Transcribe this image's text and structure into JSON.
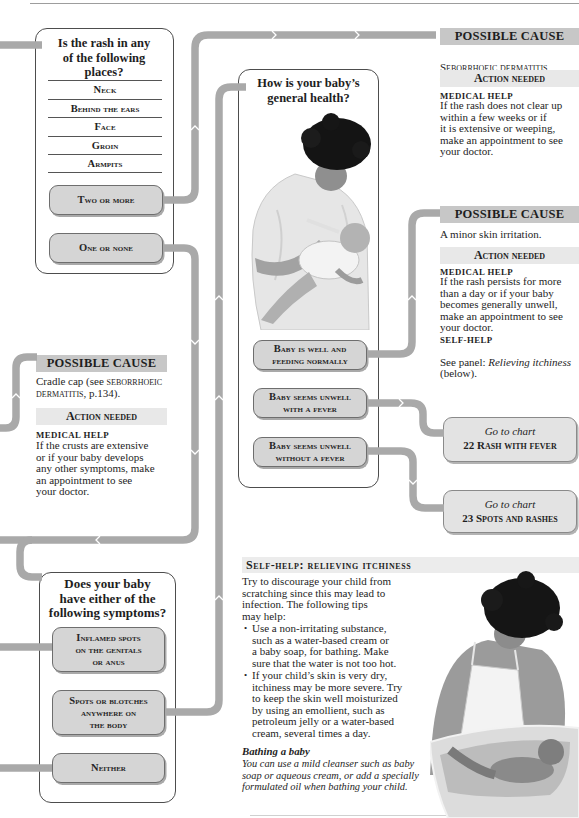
{
  "colors": {
    "connector": "#a9a9a9",
    "hdr-cause": "#c7c7c7",
    "hdr-action": "#e8e8e8",
    "option-fill": "#d5d5d5",
    "goto-fill": "#e3e3e3",
    "border": "#4d4d4d"
  },
  "images": {
    "feeding_photo": "mother bottle-feeding baby",
    "bathing_photo": "mother bathing baby in tub"
  },
  "question_location": {
    "title": "Is the rash in any\nof the following\nplaces?",
    "places": [
      "Neck",
      "Behind the ears",
      "Face",
      "Groin",
      "Armpits"
    ],
    "options": [
      "Two or more",
      "One or none"
    ]
  },
  "cause_seborrhoeic": {
    "header": "POSSIBLE CAUSE",
    "cause": "Seborrhoeic dermatitis",
    "cause_ref": " (p.134).",
    "action_header": "Action needed",
    "medical_label": "MEDICAL HELP",
    "medical_text": "If the rash does not clear up\nwithin a few weeks or if\nit is extensive or weeping,\nmake an appointment to see\nyour doctor."
  },
  "question_health": {
    "title": "How is your baby’s\ngeneral health?",
    "options": [
      "Baby is well and\nfeeding normally",
      "Baby seems unwell\nwith a fever",
      "Baby seems unwell\nwithout a fever"
    ]
  },
  "cause_minor": {
    "header": "POSSIBLE CAUSE",
    "cause": "A minor skin irritation.",
    "action_header": "Action needed",
    "medical_label": "MEDICAL HELP",
    "medical_text": "If the rash persists for more\nthan a day or if your baby\nbecomes generally unwell,\nmake an appointment to see\nyour doctor.",
    "selfhelp_label": "SELF-HELP",
    "selfhelp_prefix": "See panel: ",
    "selfhelp_link": "Relieving itchiness",
    "selfhelp_suffix": " (below)."
  },
  "goto": [
    {
      "prefix": "Go to chart",
      "number": "22",
      "title": "Rash with fever"
    },
    {
      "prefix": "Go to chart",
      "number": "23",
      "title": "Spots and rashes"
    }
  ],
  "cause_cradle": {
    "header": "POSSIBLE CAUSE",
    "cause_prefix": "Cradle cap (see ",
    "cause_ref": "seborrhoeic dermatitis",
    "cause_suffix": ", p.134).",
    "action_header": "Action needed",
    "medical_label": "MEDICAL HELP",
    "medical_text": "If the crusts are extensive\nor if your baby develops\nany other symptoms, make\nan appointment to see\nyour doctor."
  },
  "question_symptoms": {
    "title": "Does your baby\nhave either of the\nfollowing symptoms?",
    "options": [
      "Inflamed spots\non the genitals\nor anus",
      "Spots or blotches\nanywhere on\nthe body",
      "Neither"
    ]
  },
  "selfhelp_panel": {
    "title": "Self-help: relieving itchiness",
    "intro": "Try to discourage your child from\nscratching since this may lead to\ninfection. The following tips\nmay help:",
    "bullets": [
      "Use a non-irritating substance,\nsuch as a water-based cream or\na baby soap, for bathing. Make\nsure that the water is not too hot.",
      "If your child’s skin is very dry,\nitchiness may be more severe. Try\nto keep the skin well moisturized\nby using an emollient, such as\npetroleum jelly or a water-based\ncream, several times a day."
    ],
    "subhead": "Bathing a baby",
    "note": "You can use a mild cleanser such as baby\nsoap or aqueous cream, or add a specially\nformulated oil when bathing your child."
  }
}
